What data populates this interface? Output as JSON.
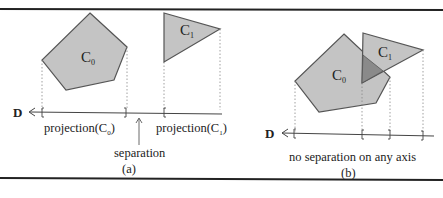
{
  "panel_a": {
    "shape0": {
      "label": "C",
      "sub": "0"
    },
    "shape1": {
      "label": "C",
      "sub": "1"
    },
    "axis_label": "D",
    "proj0": {
      "text": "projection(C",
      "sub": "0",
      "close": ")"
    },
    "proj1": {
      "text": "projection(C",
      "sub": "1",
      "close": ")"
    },
    "separation": "separation",
    "caption": "(a)"
  },
  "panel_b": {
    "shape0": {
      "label": "C",
      "sub": "0"
    },
    "shape1": {
      "label": "C",
      "sub": "1"
    },
    "axis_label": "D",
    "note": "no separation on any axis",
    "caption": "(b)"
  },
  "colors": {
    "fill": "#c4c4c4",
    "overlap": "#8a8a8a",
    "stroke": "#555555",
    "rule": "#222222"
  }
}
